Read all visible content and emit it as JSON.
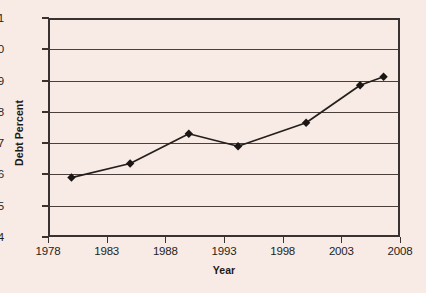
{
  "chart_data": {
    "type": "line",
    "title": "",
    "xlabel": "Year",
    "ylabel": "Debt Percent",
    "xlim": [
      1978,
      2008
    ],
    "ylim": [
      14,
      21
    ],
    "grid": true,
    "legend": "none",
    "marker": "diamond",
    "x_ticks": [
      1978,
      1983,
      1988,
      1993,
      1998,
      2003,
      2008
    ],
    "y_ticks": [
      14,
      15,
      16,
      17,
      18,
      19,
      20,
      21
    ],
    "series": [
      {
        "name": "Debt Percent",
        "points": [
          {
            "x": 1980.0,
            "y": 15.9
          },
          {
            "x": 1985.0,
            "y": 16.35
          },
          {
            "x": 1990.0,
            "y": 17.3
          },
          {
            "x": 1994.2,
            "y": 16.9
          },
          {
            "x": 2000.0,
            "y": 17.65
          },
          {
            "x": 2004.6,
            "y": 18.85
          },
          {
            "x": 2006.6,
            "y": 19.12
          }
        ]
      }
    ],
    "colors": {
      "background": "#f8eae4",
      "line": "#241f1d",
      "marker": "#1a1614",
      "grid": "#4a3f3b",
      "axis": "#3a3230",
      "text": "#231f1d"
    }
  }
}
